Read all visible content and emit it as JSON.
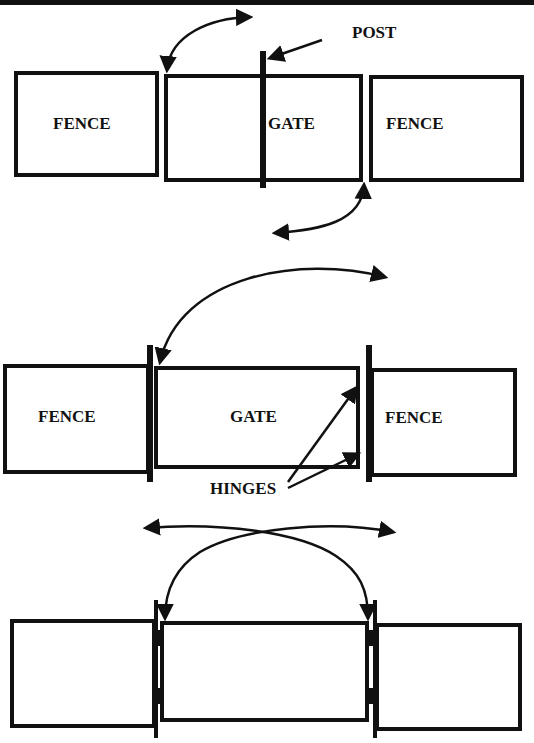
{
  "diagram": {
    "title": "",
    "panels": [
      {
        "name": "single-gate-center-post",
        "labels": {
          "fence_left": "FENCE",
          "gate": "GATE",
          "fence_right": "FENCE",
          "post": "POST"
        }
      },
      {
        "name": "single-gate-side-hinged",
        "labels": {
          "fence_left": "FENCE",
          "gate": "GATE",
          "fence_right": "FENCE",
          "hinges": "HINGES"
        }
      },
      {
        "name": "double-hinged-gate",
        "labels": {}
      }
    ],
    "colors": {
      "stroke": "#111111",
      "background": "#ffffff"
    }
  }
}
